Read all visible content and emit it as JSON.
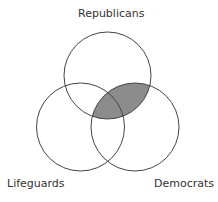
{
  "diagram": {
    "type": "venn",
    "sets": [
      {
        "id": "top",
        "label": "Republicans"
      },
      {
        "id": "left",
        "label": "Lifeguards"
      },
      {
        "id": "right",
        "label": "Democrats"
      }
    ],
    "shaded_region": "Republicans ∩ Democrats",
    "colors": {
      "stroke": "#444444",
      "shade": "#8c8c8c",
      "background": "#ffffff"
    }
  }
}
